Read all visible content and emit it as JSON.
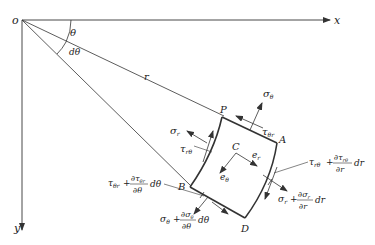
{
  "diagram": {
    "axes": {
      "origin": "o",
      "x": "x",
      "y": "y"
    },
    "angles": {
      "theta": "θ",
      "dtheta": "dθ"
    },
    "radius": "r",
    "points": {
      "P": "P",
      "A": "A",
      "B": "B",
      "C": "C",
      "D": "D"
    },
    "unit_vectors": {
      "e_r": "e",
      "e_r_sub": "r",
      "e_theta": "e",
      "e_theta_sub": "θ"
    },
    "stresses": {
      "sigma_r": {
        "main": "σ",
        "sub": "r"
      },
      "sigma_theta": {
        "main": "σ",
        "sub": "θ"
      },
      "tau_r_theta": {
        "main": "τ",
        "sub": "rθ"
      },
      "tau_theta_r": {
        "main": "τ",
        "sub": "θr"
      },
      "tau_r_theta_plus": {
        "main": "τ",
        "sub": "rθ",
        "op": "+",
        "num": "∂τ",
        "num_sub": "rθ",
        "den": "∂r",
        "diff": "dr"
      },
      "sigma_r_plus": {
        "main": "σ",
        "sub": "r",
        "op": "+",
        "num": "∂σ",
        "num_sub": "r",
        "den": "∂r",
        "diff": "dr"
      },
      "tau_theta_r_plus": {
        "main": "τ",
        "sub": "θr",
        "op": "+",
        "num": "∂τ",
        "num_sub": "θr",
        "den": "∂θ",
        "diff": "dθ"
      },
      "sigma_theta_plus": {
        "main": "σ",
        "sub": "θ",
        "op": "+",
        "num": "∂σ",
        "num_sub": "θ",
        "den": "∂θ",
        "diff": "dθ"
      }
    }
  }
}
